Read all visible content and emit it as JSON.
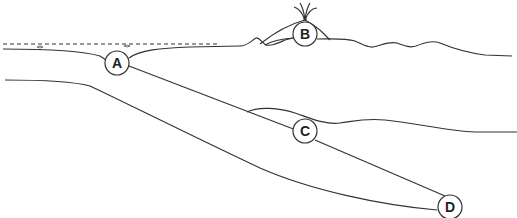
{
  "diagram": {
    "type": "cross-section",
    "colors": {
      "stroke": "#333333",
      "background": "#ffffff"
    },
    "markers": [
      {
        "id": "A",
        "label": "A",
        "location": "trench / sea floor where plate bends downward"
      },
      {
        "id": "B",
        "label": "B",
        "location": "volcano on surface"
      },
      {
        "id": "C",
        "label": "C",
        "location": "on upper surface of descending slab beneath crust"
      },
      {
        "id": "D",
        "label": "D",
        "location": "deep end of descending slab"
      }
    ],
    "features": [
      {
        "name": "sea-level",
        "style": "dashed"
      },
      {
        "name": "ocean-floor"
      },
      {
        "name": "descending-plate"
      },
      {
        "name": "volcano-eruption"
      },
      {
        "name": "continental-crust-base"
      }
    ]
  }
}
